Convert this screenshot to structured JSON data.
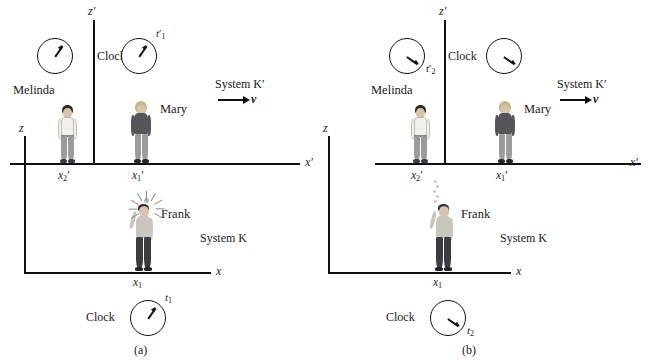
{
  "figure": {
    "kind": "physics-diagram",
    "colors": {
      "ink": "#1a1a1a",
      "axis": "#111111",
      "background": "#ffffff",
      "skin": "#d8c3ae",
      "hair_dark": "#2e2a28",
      "hair_blonde": "#c9b684",
      "shirt_light": "#f2f0ec",
      "jacket_dark": "#55555a",
      "pants_gray": "#9b9b9e",
      "pants_dark": "#3b3b44",
      "shoe": "#23232a",
      "smoke": "#c9c9c9",
      "flash": "#b9b9b9"
    }
  },
  "panels": [
    {
      "caption": "(a)",
      "system_primed": {
        "label": "System K′",
        "velocity_label": "v",
        "axis_x": "x′",
        "axis_z": "z′",
        "clock_word": "Clock",
        "clocks": [
          {
            "name": "melinda-clock",
            "time_label": "",
            "time_sub": "",
            "hand_angle": -55
          },
          {
            "name": "mary-clock",
            "time_label": "t",
            "time_sub": "1",
            "primed": true,
            "hand_angle": -55
          }
        ],
        "people": [
          {
            "name": "Melinda",
            "coord": "x",
            "coord_sub": "2",
            "coord_primed": true
          },
          {
            "name": "Mary",
            "coord": "x",
            "coord_sub": "1",
            "coord_primed": true
          }
        ]
      },
      "system_unprimed": {
        "label": "System K",
        "axis_x": "x",
        "axis_z": "z",
        "clock_word": "Clock",
        "clock": {
          "name": "frank-clock",
          "time_label": "t",
          "time_sub": "1",
          "primed": false,
          "hand_angle": -55
        },
        "person": {
          "name": "Frank",
          "coord": "x",
          "coord_sub": "1",
          "coord_primed": false,
          "flashbulb": "flashing"
        }
      }
    },
    {
      "caption": "(b)",
      "system_primed": {
        "label": "System K′",
        "velocity_label": "v",
        "axis_x": "x′",
        "axis_z": "z′",
        "clock_word": "Clock",
        "clocks": [
          {
            "name": "melinda-clock",
            "time_label": "t",
            "time_sub": "2",
            "primed": true,
            "hand_angle": 35
          },
          {
            "name": "mary-clock",
            "time_label": "",
            "time_sub": "",
            "hand_angle": 35
          }
        ],
        "people": [
          {
            "name": "Melinda",
            "coord": "x",
            "coord_sub": "2",
            "coord_primed": true
          },
          {
            "name": "Mary",
            "coord": "x",
            "coord_sub": "1",
            "coord_primed": true
          }
        ]
      },
      "system_unprimed": {
        "label": "System K",
        "axis_x": "x",
        "axis_z": "z",
        "clock_word": "Clock",
        "clock": {
          "name": "frank-clock",
          "time_label": "t",
          "time_sub": "2",
          "primed": false,
          "hand_angle": 35
        },
        "person": {
          "name": "Frank",
          "coord": "x",
          "coord_sub": "1",
          "coord_primed": false,
          "flashbulb": "smoking"
        }
      }
    }
  ]
}
